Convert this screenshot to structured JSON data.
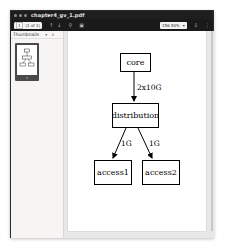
{
  "window": {
    "title": "chapter4_gv_1.pdf"
  },
  "toolbar": {
    "page_current": "1",
    "page_total": "(1 of 1)",
    "prev_icon": "chevron-up-icon",
    "next_icon": "chevron-down-icon",
    "search_icon": "search-icon",
    "annotate_icon": "annotate-icon",
    "zoom_value": "156.50%",
    "zoom_dropdown_icon": "▾",
    "download_icon": "download-icon",
    "menu_icon": "menu-icon"
  },
  "sidebar": {
    "header_label": "Thumbnails",
    "header_dropdown": "▾",
    "header_close": "×",
    "thumbnail_page_label": "1"
  },
  "diagram": {
    "nodes": [
      {
        "id": "core",
        "label": "core"
      },
      {
        "id": "distribution",
        "label": "distribution"
      },
      {
        "id": "access1",
        "label": "access1"
      },
      {
        "id": "access2",
        "label": "access2"
      }
    ],
    "edges": [
      {
        "from": "core",
        "to": "distribution",
        "label": "2x10G"
      },
      {
        "from": "distribution",
        "to": "access1",
        "label": "1G"
      },
      {
        "from": "distribution",
        "to": "access2",
        "label": "1G"
      }
    ]
  }
}
